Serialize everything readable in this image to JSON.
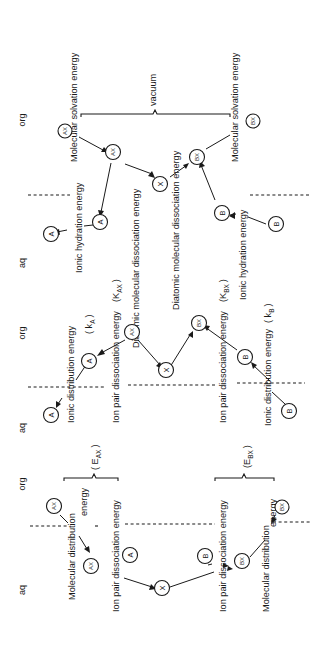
{
  "figure": {
    "orientation": "rotated 90 degrees counter-clockwise",
    "phases": [
      {
        "id": "p1_aq",
        "label": "aq"
      },
      {
        "id": "p1_org",
        "label": "org"
      },
      {
        "id": "p2_aq",
        "label": "aq"
      },
      {
        "id": "p2_org",
        "label": "org"
      },
      {
        "id": "p3_aq",
        "label": "aq"
      },
      {
        "id": "p3_org",
        "label": "org"
      }
    ],
    "vacuum_label": "vacuum",
    "species": {
      "AX": "AX",
      "BX": "BX",
      "A": "A",
      "B": "B",
      "X": "X"
    },
    "panel_top": {
      "molecular_solvation_energy_ax": "Molecular solvation energy",
      "molecular_solvation_energy_bx": "Molecular solvation energy",
      "diatomic_dissociation_ax": "Diatomic molecular dissociation energy",
      "diatomic_dissociation_bx": "Diatomic molecular dissociation energy",
      "ionic_hydration_energy_a": "Ionic hydration energy",
      "ionic_hydration_energy_b": "Ionic hydration energy"
    },
    "panel_middle": {
      "ionic_distribution_a": "Ionic distribution energy",
      "k_a": "( k",
      "k_a_sub": "A",
      "k_a_close": ")",
      "ion_pair_dissociation_ax": "Ion pair dissociation energy",
      "K_ax": "(K",
      "K_ax_sub": "AX",
      "K_ax_close": ")",
      "ion_pair_dissociation_bx": "Ion pair dissociation energy",
      "K_bx": "(K",
      "K_bx_sub": "BX",
      "K_bx_close": ")",
      "ionic_distribution_b": "Ionic distribution energy",
      "k_b": "( k",
      "k_b_sub": "B",
      "k_b_close": ")"
    },
    "panel_bottom": {
      "molecular_distribution_ax_1": "Molecular distribution",
      "molecular_distribution_ax_2": "energy",
      "ion_pair_dissociation_ax": "Ion pair dissociation energy",
      "E_ax": "( E",
      "E_ax_sub": "AX",
      "E_ax_close": ")",
      "ion_pair_dissociation_bx": "Ion pair dissociation energy",
      "molecular_distribution_bx_1": "Molecular distribution",
      "molecular_distribution_bx_2": "energy",
      "E_bx": "(E",
      "E_bx_sub": "BX",
      "E_bx_close": ")"
    }
  }
}
